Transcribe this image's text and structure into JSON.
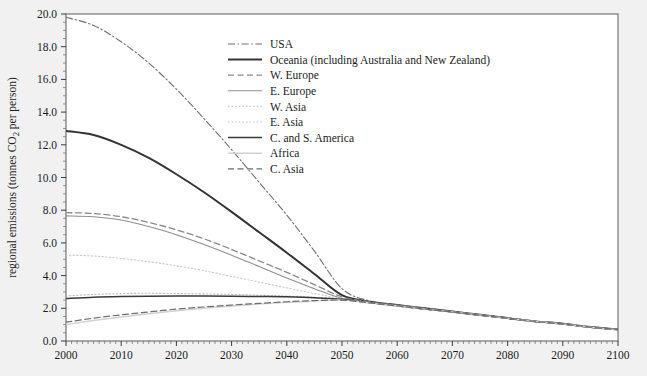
{
  "figure": {
    "background_color": "#f1f1f1",
    "plot_background_color": "#ffffff",
    "frame_color": "#555555",
    "top_caption": "",
    "bottom_caption": ""
  },
  "axes": {
    "y_axis_title": "regional emissions (tonnes CO2 per person)",
    "y_axis_title_parts": {
      "pre": "regional emissions (tonnes CO",
      "sub": "2",
      "post": " per person)"
    },
    "x_axis_title": "",
    "y_ticks": [
      "0.0",
      "2.0",
      "4.0",
      "6.0",
      "8.0",
      "10.0",
      "12.0",
      "14.0",
      "16.0",
      "18.0",
      "20.0"
    ],
    "x_ticks": [
      "2000",
      "2010",
      "2020",
      "2030",
      "2040",
      "2050",
      "2060",
      "2070",
      "2080",
      "2090",
      "2100"
    ]
  },
  "legend": {
    "position": "top-center-right",
    "items": [
      {
        "label": "USA",
        "style": "dashdot",
        "color": "#6e6e6e",
        "width": 1.1
      },
      {
        "label": "Oceania (including Australia and New Zealand)",
        "style": "solid",
        "color": "#333333",
        "width": 2.0
      },
      {
        "label": "W. Europe",
        "style": "dashed",
        "color": "#8a8a8a",
        "width": 1.3
      },
      {
        "label": "E. Europe",
        "style": "solid",
        "color": "#8f8f8f",
        "width": 1.1
      },
      {
        "label": "W. Asia",
        "style": "dotted",
        "color": "#c9c9c9",
        "width": 1.1
      },
      {
        "label": "E. Asia",
        "style": "dotted",
        "color": "#bdbdbd",
        "width": 1.1
      },
      {
        "label": "C. and S. America",
        "style": "solid",
        "color": "#3a3a3a",
        "width": 1.5
      },
      {
        "label": "Africa",
        "style": "solid",
        "color": "#d2d2d2",
        "width": 1.4
      },
      {
        "label": "C. Asia",
        "style": "dashed",
        "color": "#6e6e6e",
        "width": 1.2
      }
    ]
  },
  "chart_data": {
    "type": "line",
    "title": "",
    "xlabel": "",
    "ylabel": "regional emissions (tonnes CO2 per person)",
    "xlim": [
      2000,
      2100
    ],
    "ylim": [
      0.0,
      20.0
    ],
    "grid": false,
    "legend_position": "upper center",
    "x": [
      2000,
      2005,
      2010,
      2015,
      2020,
      2025,
      2030,
      2035,
      2040,
      2045,
      2050,
      2055,
      2060,
      2065,
      2070,
      2075,
      2080,
      2085,
      2090,
      2095,
      2100
    ],
    "series": [
      {
        "name": "USA",
        "style": "dashdot",
        "values": [
          19.8,
          19.3,
          18.3,
          17.0,
          15.4,
          13.6,
          11.7,
          9.7,
          7.7,
          5.5,
          3.2,
          2.45,
          2.2,
          2.0,
          1.8,
          1.6,
          1.4,
          1.2,
          1.05,
          0.85,
          0.7
        ]
      },
      {
        "name": "Oceania (including Australia and New Zealand)",
        "style": "solid",
        "values": [
          12.85,
          12.6,
          12.0,
          11.2,
          10.2,
          9.1,
          7.9,
          6.65,
          5.4,
          4.1,
          2.8,
          2.4,
          2.2,
          2.0,
          1.8,
          1.6,
          1.4,
          1.2,
          1.05,
          0.85,
          0.7
        ]
      },
      {
        "name": "W. Europe",
        "style": "dashed",
        "values": [
          7.85,
          7.8,
          7.6,
          7.25,
          6.8,
          6.25,
          5.6,
          4.9,
          4.2,
          3.45,
          2.7,
          2.4,
          2.2,
          2.0,
          1.8,
          1.6,
          1.4,
          1.2,
          1.05,
          0.85,
          0.7
        ]
      },
      {
        "name": "E. Europe",
        "style": "solid",
        "values": [
          7.65,
          7.6,
          7.4,
          7.0,
          6.5,
          5.9,
          5.25,
          4.55,
          3.85,
          3.2,
          2.6,
          2.35,
          2.15,
          1.95,
          1.78,
          1.58,
          1.4,
          1.2,
          1.05,
          0.85,
          0.7
        ]
      },
      {
        "name": "W. Asia",
        "style": "dotted",
        "values": [
          5.25,
          5.2,
          5.05,
          4.85,
          4.6,
          4.3,
          3.95,
          3.6,
          3.25,
          2.9,
          2.6,
          2.35,
          2.15,
          1.95,
          1.78,
          1.58,
          1.4,
          1.2,
          1.05,
          0.85,
          0.7
        ]
      },
      {
        "name": "E. Asia",
        "style": "dotted",
        "values": [
          2.75,
          2.85,
          2.9,
          2.92,
          2.9,
          2.88,
          2.85,
          2.8,
          2.75,
          2.68,
          2.55,
          2.35,
          2.15,
          1.95,
          1.78,
          1.58,
          1.4,
          1.2,
          1.05,
          0.85,
          0.7
        ]
      },
      {
        "name": "C. and S. America",
        "style": "solid",
        "values": [
          2.6,
          2.68,
          2.72,
          2.74,
          2.75,
          2.75,
          2.74,
          2.72,
          2.7,
          2.65,
          2.55,
          2.35,
          2.15,
          1.95,
          1.78,
          1.58,
          1.4,
          1.2,
          1.05,
          0.85,
          0.7
        ]
      },
      {
        "name": "Africa",
        "style": "solid",
        "values": [
          1.0,
          1.25,
          1.47,
          1.67,
          1.85,
          2.0,
          2.14,
          2.26,
          2.36,
          2.45,
          2.5,
          2.33,
          2.14,
          1.95,
          1.78,
          1.58,
          1.4,
          1.2,
          1.05,
          0.85,
          0.7
        ]
      },
      {
        "name": "C. Asia",
        "style": "dashed",
        "values": [
          1.15,
          1.4,
          1.6,
          1.78,
          1.95,
          2.08,
          2.2,
          2.3,
          2.4,
          2.47,
          2.5,
          2.33,
          2.14,
          1.95,
          1.78,
          1.58,
          1.4,
          1.2,
          1.05,
          0.85,
          0.7
        ]
      }
    ],
    "convergence": {
      "year": 2050,
      "value": 2.5
    },
    "endpoint": {
      "year": 2100,
      "value": 0.7
    }
  }
}
